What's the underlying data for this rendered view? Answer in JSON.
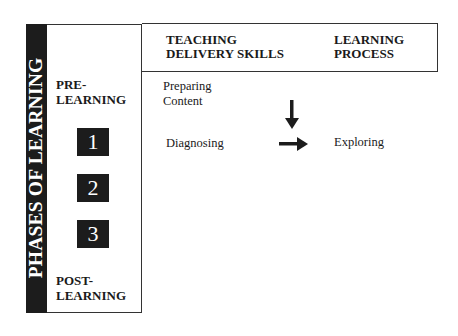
{
  "diagram": {
    "vertical_title": "PHASES OF LEARNING",
    "phases": {
      "start_label": "PRE-\nLEARNING",
      "start_line1": "PRE-",
      "start_line2": "LEARNING",
      "steps": [
        "1",
        "2",
        "3"
      ],
      "end_line1": "POST-",
      "end_line2": "LEARNING"
    },
    "columns": {
      "teaching_line1": "TEACHING",
      "teaching_line2": "DELIVERY SKILLS",
      "learning_line1": "LEARNING",
      "learning_line2": "PROCESS"
    },
    "rows": {
      "preparing_line1": "Preparing",
      "preparing_line2": "Content",
      "diagnosing": "Diagnosing",
      "exploring": "Exploring"
    },
    "arrows": [
      "down",
      "right"
    ],
    "colors": {
      "dark": "#1c1c1c",
      "line": "#333333",
      "background": "#ffffff"
    }
  }
}
